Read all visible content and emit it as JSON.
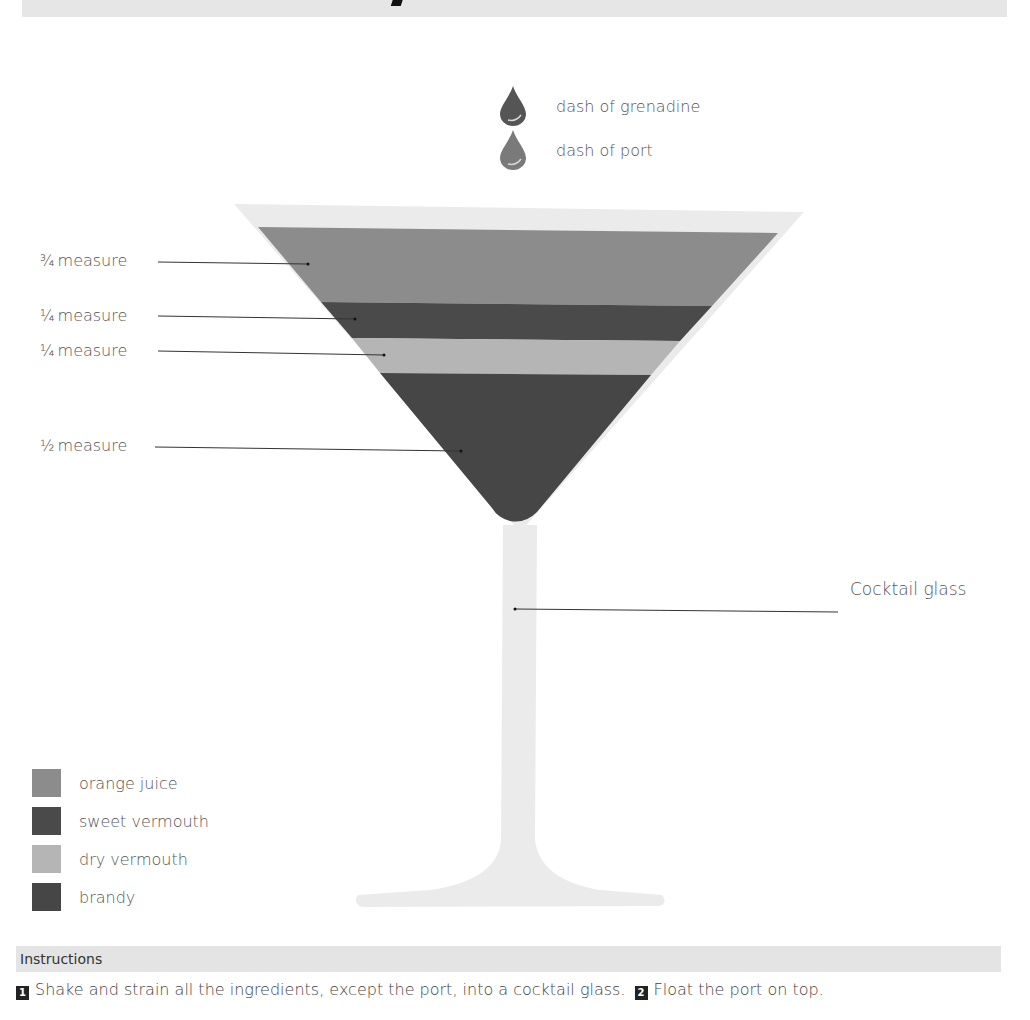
{
  "colors": {
    "glass": "#e9e9e9",
    "orange_juice": "#8c8c8c",
    "sweet_vermouth": "#4a4a4a",
    "dry_vermouth": "#b5b5b5",
    "brandy": "#464646",
    "grenadine_drop": "#555555",
    "port_drop": "#7a7a7a",
    "header_bar": "#e4e4e4"
  },
  "garnishes": [
    {
      "icon": "drop-icon",
      "label": "dash of grenadine"
    },
    {
      "icon": "drop-icon",
      "label": "dash of port"
    }
  ],
  "layers": [
    {
      "ingredient": "orange juice",
      "fraction": "¾",
      "measure_label": "measure"
    },
    {
      "ingredient": "sweet vermouth",
      "fraction": "¼",
      "measure_label": "measure"
    },
    {
      "ingredient": "dry vermouth",
      "fraction": "¼",
      "measure_label": "measure"
    },
    {
      "ingredient": "brandy",
      "fraction": "½",
      "measure_label": "measure"
    }
  ],
  "glass_label": "Cocktail glass",
  "legend": [
    {
      "label": "orange juice",
      "color_key": "orange_juice"
    },
    {
      "label": "sweet vermouth",
      "color_key": "sweet_vermouth"
    },
    {
      "label": "dry vermouth",
      "color_key": "dry_vermouth"
    },
    {
      "label": "brandy",
      "color_key": "brandy"
    }
  ],
  "instructions": {
    "header": "Instructions",
    "steps": [
      {
        "number": "1",
        "text": "Shake and strain all the ingredients, except the port, into a cocktail glass."
      },
      {
        "number": "2",
        "text": "Float the port on top."
      }
    ]
  }
}
